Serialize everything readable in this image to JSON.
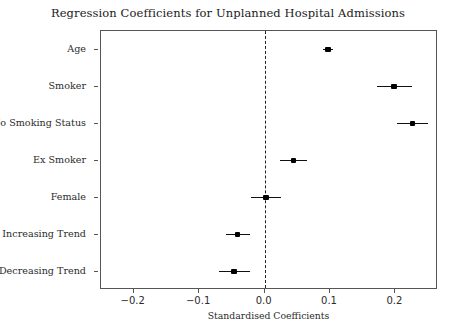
{
  "chart_data": {
    "type": "scatter",
    "title": "Regression Coefficients for Unplanned Hospital Admissions",
    "xlabel": "Standardised Coefficients",
    "ylabel": "",
    "xlim": [
      -0.25,
      0.265
    ],
    "grid": false,
    "legend": null,
    "reference_line": {
      "x": 0.0,
      "style": "dashed",
      "color": "#222222"
    },
    "xticks": [
      -0.2,
      -0.1,
      0.0,
      0.1,
      0.2
    ],
    "xticklabels": [
      "−0.2",
      "−0.1",
      "0.0",
      "0.1",
      "0.2"
    ],
    "categories": [
      "Age",
      "Smoker",
      "No Smoking Status",
      "Ex Smoker",
      "Female",
      "Increasing Trend",
      "Decreasing Trend"
    ],
    "values": [
      0.097,
      0.198,
      0.226,
      0.044,
      0.002,
      -0.041,
      -0.047
    ],
    "ci_low": [
      0.089,
      0.172,
      0.202,
      0.023,
      -0.021,
      -0.059,
      -0.07
    ],
    "ci_high": [
      0.105,
      0.225,
      0.249,
      0.065,
      0.025,
      -0.023,
      -0.023
    ],
    "points": [
      {
        "label": "Age",
        "value": 0.097,
        "ci_low": 0.089,
        "ci_high": 0.105
      },
      {
        "label": "Smoker",
        "value": 0.198,
        "ci_low": 0.172,
        "ci_high": 0.225
      },
      {
        "label": "No Smoking Status",
        "value": 0.226,
        "ci_low": 0.202,
        "ci_high": 0.249
      },
      {
        "label": "Ex Smoker",
        "value": 0.044,
        "ci_low": 0.023,
        "ci_high": 0.065
      },
      {
        "label": "Female",
        "value": 0.002,
        "ci_low": -0.021,
        "ci_high": 0.025
      },
      {
        "label": "Increasing Trend",
        "value": -0.041,
        "ci_low": -0.059,
        "ci_high": -0.023
      },
      {
        "label": "Decreasing Trend",
        "value": -0.047,
        "ci_low": -0.07,
        "ci_high": -0.023
      }
    ],
    "colors": {
      "marker": "#000000",
      "error_bar": "#111111",
      "reference_line": "#222222",
      "axis": "#555555",
      "text": "#2b2b2b",
      "background": "#ffffff"
    }
  }
}
